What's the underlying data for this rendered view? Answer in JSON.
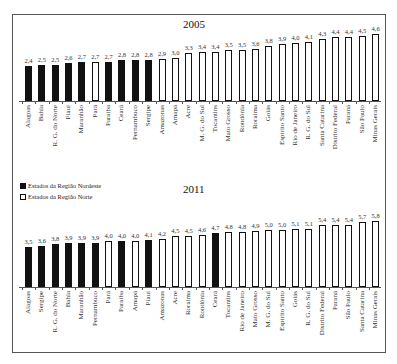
{
  "chart_data": [
    {
      "type": "bar",
      "title": "2005",
      "xlabel": "",
      "ylabel": "",
      "legend_position": "between charts, upper-left",
      "grid": false,
      "categories": [
        "Alagoas",
        "Bahia",
        "R. G. do Norte",
        "Piauí",
        "Maranhão",
        "Pará",
        "Paraíba",
        "Ceará",
        "Pernambuco",
        "Sergipe",
        "Amazonas",
        "Amapá",
        "Acre",
        "M. G. do Sul",
        "Tocantins",
        "Mato Grosso",
        "Rondônia",
        "Roraima",
        "Goiás",
        "Espírito Santo",
        "Rio de Janeiro",
        "R. G. do Sul",
        "Santa Catarina",
        "Distrito Federal",
        "Paraná",
        "São Paulo",
        "Minas Gerais"
      ],
      "values": [
        2.4,
        2.5,
        2.5,
        2.6,
        2.7,
        2.7,
        2.7,
        2.8,
        2.8,
        2.8,
        2.9,
        3.0,
        3.3,
        3.4,
        3.4,
        3.5,
        3.5,
        3.6,
        3.8,
        3.9,
        4.0,
        4.1,
        4.3,
        4.4,
        4.4,
        4.5,
        4.6
      ],
      "value_labels": [
        "2,4",
        "2,5",
        "2,5",
        "2,6",
        "2,7",
        "2,7",
        "2,7",
        "2,8",
        "2,8",
        "2,8",
        "2,9",
        "3,0",
        "3,3",
        "3,4",
        "3,4",
        "3,5",
        "3,5",
        "3,6",
        "3,8",
        "3,9",
        "4,0",
        "4,1",
        "4,3",
        "4,4",
        "4,4",
        "4,5",
        "4,6"
      ],
      "groups": [
        "ne",
        "ne",
        "ne",
        "ne",
        "ne",
        "no",
        "ne",
        "ne",
        "ne",
        "ne",
        "no",
        "no",
        "no",
        "o",
        "no",
        "o",
        "no",
        "no",
        "o",
        "o",
        "o",
        "o",
        "o",
        "o",
        "o",
        "o",
        "o"
      ]
    },
    {
      "type": "bar",
      "title": "2011",
      "xlabel": "",
      "ylabel": "",
      "grid": false,
      "categories": [
        "Alagoas",
        "Sergipe",
        "R. G. do Norte",
        "Bahia",
        "Maranhão",
        "Pernambuco",
        "Pará",
        "Paraíba",
        "Amapá",
        "Piauí",
        "Amazonas",
        "Acre",
        "Roraima",
        "Rondônia",
        "Ceará",
        "Tocantins",
        "Rio de Janeiro",
        "Mato Grosso",
        "M. G. do Sul",
        "Espírito Santo",
        "Goiás",
        "R. G. do Sul",
        "Distrito Federal",
        "Paraná",
        "São Paulo",
        "Santa Catarina",
        "Minas Gerais"
      ],
      "values": [
        3.5,
        3.6,
        3.8,
        3.9,
        3.9,
        3.9,
        4.0,
        4.0,
        4.0,
        4.1,
        4.2,
        4.5,
        4.5,
        4.6,
        4.7,
        4.8,
        4.8,
        4.9,
        5.0,
        5.0,
        5.1,
        5.1,
        5.4,
        5.4,
        5.4,
        5.7,
        5.8
      ],
      "value_labels": [
        "3,5",
        "3,6",
        "3,8",
        "3,9",
        "3,9",
        "3,9",
        "4,0",
        "4,0",
        "4,0",
        "4,1",
        "4,2",
        "4,5",
        "4,5",
        "4,6",
        "4,7",
        "4,8",
        "4,8",
        "4,9",
        "5,0",
        "5,0",
        "5,1",
        "5,1",
        "5,4",
        "5,4",
        "5,4",
        "5,7",
        "5,8"
      ],
      "groups": [
        "ne",
        "ne",
        "ne",
        "ne",
        "ne",
        "ne",
        "no",
        "ne",
        "no",
        "ne",
        "no",
        "no",
        "no",
        "no",
        "ne",
        "no",
        "o",
        "o",
        "o",
        "o",
        "o",
        "o",
        "o",
        "o",
        "o",
        "o",
        "o"
      ]
    }
  ],
  "legend": {
    "items": [
      {
        "label": "Estados da Região Nordeste",
        "style": "filled-black"
      },
      {
        "label": "Estados da Região Norte",
        "style": "hollow-white"
      }
    ]
  },
  "colors": {
    "nordeste": "#111111",
    "outros": "#ffffff",
    "outline": "#111111"
  }
}
